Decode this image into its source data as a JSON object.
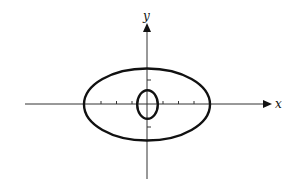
{
  "diagram": {
    "type": "coordinate-plane-ellipses",
    "axes": {
      "x_label": "x",
      "y_label": "y",
      "x_ticks": [
        -3,
        -2,
        -1,
        1,
        2,
        3
      ],
      "y_ticks": [
        -2,
        2
      ]
    },
    "curves": [
      {
        "name": "outer-ellipse",
        "center": [
          0,
          0
        ],
        "semi_axis_x": 4,
        "semi_axis_y": 2.3
      },
      {
        "name": "inner-ellipse",
        "center": [
          0,
          0
        ],
        "semi_axis_x": 0.7,
        "semi_axis_y": 0.95
      }
    ],
    "colors": {
      "stroke": "#111111",
      "background": "#ffffff"
    }
  }
}
